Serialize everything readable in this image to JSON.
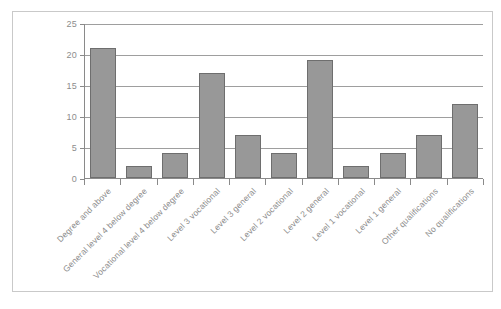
{
  "chart_data": {
    "type": "bar",
    "title": "",
    "subtitle": "",
    "xlabel": "",
    "ylabel": "",
    "ylim": [
      0,
      25
    ],
    "yticks": [
      0,
      5,
      10,
      15,
      20,
      25
    ],
    "grid": "horizontal",
    "legend": "none",
    "categories": [
      "Degree and above",
      "General level 4 below degree",
      "Vocational level 4 below degree",
      "Level 3 vocational",
      "Level 3 general",
      "Level 2 vocational",
      "Level 2 general",
      "Level 1 vocational",
      "Level 1 general",
      "Other qualifications",
      "No qualifications"
    ],
    "values": [
      21,
      2,
      4,
      17,
      7,
      4,
      19,
      2,
      4,
      7,
      12
    ],
    "colors": {
      "bar_fill": "#989898",
      "bar_border": "#6e6e6e",
      "gridline": "#9e9e9e",
      "axis": "#8a8a8a",
      "tick_text": "#8d8d8d",
      "frame": "#c9c9c9",
      "background": "#ffffff"
    }
  }
}
